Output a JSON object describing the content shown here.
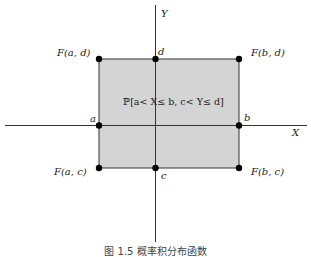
{
  "diagram": {
    "axes": {
      "x_label": "X",
      "y_label": "Y"
    },
    "region": {
      "label": "ℙ[a< X≤ b, c< Y≤ d]",
      "fill_color": "#d4d4d4",
      "edge_color": "#333333"
    },
    "axis_ticks": {
      "a": "a",
      "b": "b",
      "c": "c",
      "d": "d"
    },
    "corners": {
      "top_left": "F(a, d)",
      "top_right": "F(b, d)",
      "bottom_left": "F(a, c)",
      "bottom_right": "F(b, c)"
    },
    "caption": "图 1.5  概率积分布函数"
  }
}
